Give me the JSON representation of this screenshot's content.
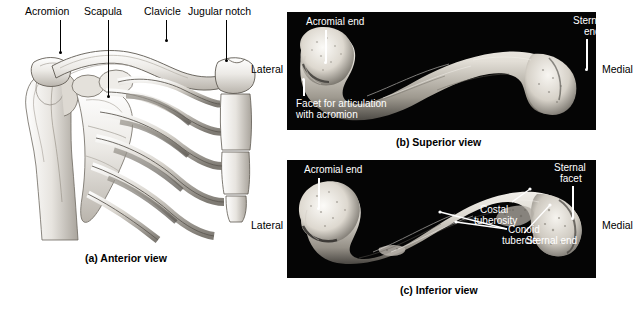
{
  "figure": {
    "subject": "Clavicle",
    "panels": [
      {
        "id": "a",
        "caption": "(a) Anterior view",
        "type": "illustration",
        "labels": [
          {
            "name": "acromion",
            "text": "Acromion"
          },
          {
            "name": "scapula",
            "text": "Scapula"
          },
          {
            "name": "clavicle",
            "text": "Clavicle"
          },
          {
            "name": "jugular-notch",
            "text": "Jugular notch"
          }
        ]
      },
      {
        "id": "b",
        "caption": "(b) Superior view",
        "type": "photograph",
        "orientation_left": "Lateral",
        "orientation_right": "Medial",
        "labels": [
          {
            "name": "acromial-end",
            "text": "Acromial end"
          },
          {
            "name": "sternal-end-line1",
            "text": "Sternal"
          },
          {
            "name": "sternal-end-line2",
            "text": "end"
          },
          {
            "name": "facet-line1",
            "text": "Facet for articulation"
          },
          {
            "name": "facet-line2",
            "text": "with acromion"
          }
        ]
      },
      {
        "id": "c",
        "caption": "(c) Inferior view",
        "type": "photograph",
        "orientation_left": "Lateral",
        "orientation_right": "Medial",
        "labels": [
          {
            "name": "acromial-end",
            "text": "Acromial end"
          },
          {
            "name": "sternal-facet-line1",
            "text": "Sternal"
          },
          {
            "name": "sternal-facet-line2",
            "text": "facet"
          },
          {
            "name": "costal-tuberosity-line1",
            "text": "Costal"
          },
          {
            "name": "costal-tuberosity-line2",
            "text": "tuberosity"
          },
          {
            "name": "conoid-tubercle-line1",
            "text": "Conoid"
          },
          {
            "name": "conoid-tubercle-line2",
            "text": "tubercle"
          },
          {
            "name": "sternal-end",
            "text": "Sternal end"
          }
        ]
      }
    ]
  },
  "colors": {
    "photo_background": "#050505",
    "page_background": "#ffffff",
    "bone_light": "#f2f0ec",
    "bone_mid": "#cfcac2",
    "bone_shadow": "#8d887f",
    "label_dark": "#000000",
    "label_light": "#ffffff"
  }
}
